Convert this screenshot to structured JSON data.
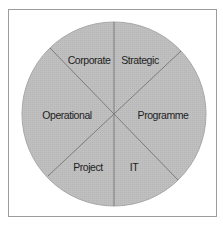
{
  "diagram": {
    "type": "segmented-circle",
    "segments": [
      {
        "id": "corporate",
        "label": "Corporate"
      },
      {
        "id": "strategic",
        "label": "Strategic"
      },
      {
        "id": "programme",
        "label": "Programme"
      },
      {
        "id": "it",
        "label": "IT"
      },
      {
        "id": "project",
        "label": "Project"
      },
      {
        "id": "operational",
        "label": "Operational"
      }
    ],
    "colors": {
      "fill": "#bdbdbd",
      "divider": "#7c7c7c",
      "outline": "#a8a8a8",
      "frame": "#9c9c9c",
      "text": "#1e1e1e"
    }
  }
}
